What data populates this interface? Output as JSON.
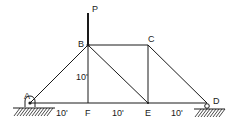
{
  "diagram": {
    "type": "truss",
    "nodes": [
      {
        "id": "A",
        "label": "A",
        "x": 30,
        "y": 103,
        "lx": 24,
        "ly": 99
      },
      {
        "id": "B",
        "label": "B",
        "x": 88,
        "y": 45,
        "lx": 79,
        "ly": 49
      },
      {
        "id": "C",
        "label": "C",
        "x": 148,
        "y": 45,
        "lx": 148,
        "ly": 40
      },
      {
        "id": "D",
        "label": "D",
        "x": 207,
        "y": 103,
        "lx": 213,
        "ly": 103
      },
      {
        "id": "E",
        "label": "E",
        "x": 148,
        "y": 103,
        "lx": 145,
        "ly": 116
      },
      {
        "id": "F",
        "label": "F",
        "x": 88,
        "y": 103,
        "lx": 85,
        "ly": 116
      }
    ],
    "members": [
      [
        "A",
        "B"
      ],
      [
        "B",
        "C"
      ],
      [
        "C",
        "D"
      ],
      [
        "A",
        "F"
      ],
      [
        "F",
        "E"
      ],
      [
        "E",
        "D"
      ],
      [
        "B",
        "F"
      ],
      [
        "B",
        "E"
      ],
      [
        "C",
        "E"
      ]
    ],
    "load": {
      "label": "P",
      "node": "B",
      "direction": "down"
    },
    "supports": [
      {
        "node": "A",
        "type": "pin"
      },
      {
        "node": "D",
        "type": "roller"
      }
    ],
    "dimensions": [
      {
        "text": "10'",
        "x": 56,
        "y": 116
      },
      {
        "text": "10'",
        "x": 112,
        "y": 116
      },
      {
        "text": "10'",
        "x": 171,
        "y": 116
      },
      {
        "text": "10'",
        "x": 76,
        "y": 80
      }
    ]
  },
  "labels": {
    "P": "P",
    "A": "A",
    "B": "B",
    "C": "C",
    "D": "D",
    "E": "E",
    "F": "F",
    "dim_af": "10'",
    "dim_fe": "10'",
    "dim_ed": "10'",
    "dim_bf": "10'"
  }
}
